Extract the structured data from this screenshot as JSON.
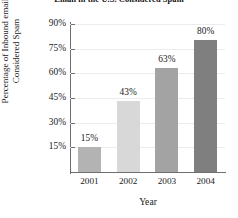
{
  "chart_data": {
    "type": "bar",
    "title": "Email in the U.S. Considered Spam",
    "xlabel": "Year",
    "ylabel": "Percentage of Inbound email",
    "ylabel_line2": "Considered Spam",
    "categories": [
      "2001",
      "2002",
      "2003",
      "2004"
    ],
    "values": [
      15,
      43,
      63,
      80
    ],
    "data_labels": [
      "15%",
      "43%",
      "63%",
      "80%"
    ],
    "ylim": [
      0,
      90
    ],
    "yticks": [
      15,
      30,
      45,
      60,
      75,
      90
    ],
    "ytick_labels": [
      "15%",
      "30%",
      "45%",
      "60%",
      "75%",
      "90%"
    ],
    "grid": true,
    "legend": "none",
    "bar_colors": [
      "#b3b3b3",
      "#d8d8d8",
      "#a3a3a3",
      "#7f7f7f"
    ],
    "axis_color": "#6e6e6e",
    "gridline_color": "#ececec",
    "background": "#ffffff"
  }
}
